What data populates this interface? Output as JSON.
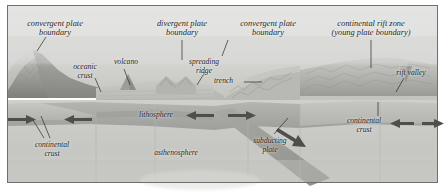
{
  "figure": {
    "type": "geologic-cross-section-block-diagram",
    "style": "grayscale airbrush illustration",
    "palette": {
      "sky": "#d8d8d6",
      "sky_low": "#c9c9c6",
      "land_light": "#cfcfcb",
      "land_mid": "#b0b0ac",
      "land_dark": "#8e8e8a",
      "ocean": "#bcbcb8",
      "lithosphere": "#a9a9a5",
      "asthenosphere": "#cbcbc7",
      "crust_block": "#bdbdb9",
      "slab": "#9d9d99",
      "arrow": "#54544f",
      "label_text": "#1c1c1c",
      "leader_line": "#2a2a26",
      "frame": "#7a7a76",
      "background": "#ffffff"
    }
  },
  "labels": {
    "convergent_left": {
      "line1": "convergent plate",
      "line2": "boundary",
      "x": 20,
      "y": 20
    },
    "oceanic_crust": {
      "line1": "oceanic",
      "line2": "crust",
      "x": 68,
      "y": 63
    },
    "volcano": {
      "line1": "volcano",
      "x": 112,
      "y": 58
    },
    "divergent": {
      "line1": "divergent plate",
      "line2": "boundary",
      "x": 152,
      "y": 20
    },
    "spreading_ridge": {
      "line1": "spreading",
      "line2": "ridge",
      "x": 185,
      "y": 58
    },
    "convergent_right": {
      "line1": "convergent plate",
      "line2": "boundary",
      "x": 228,
      "y": 20
    },
    "trench": {
      "line1": "trench",
      "x": 219,
      "y": 80
    },
    "continental_rift_zone": {
      "line1": "continental rift zone",
      "line2": "(young plate boundary)",
      "x": 330,
      "y": 20
    },
    "rift_valley": {
      "line1": "rift valley",
      "x": 389,
      "y": 70
    },
    "lithosphere": {
      "line1": "lithosphere",
      "x": 134,
      "y": 112
    },
    "asthenosphere": {
      "line1": "asthenosphere",
      "x": 148,
      "y": 150
    },
    "continental_crust_left": {
      "line1": "continental",
      "line2": "crust",
      "x": 28,
      "y": 142
    },
    "subducting_plate": {
      "line1": "subducting",
      "line2": "plate",
      "x": 251,
      "y": 138
    },
    "continental_crust_right": {
      "line1": "continental",
      "line2": "crust",
      "x": 341,
      "y": 118
    }
  },
  "motion_arrows": [
    {
      "name": "arrow-left-plate-east",
      "direction": "right",
      "x": 18,
      "y": 116
    },
    {
      "name": "arrow-oceanic-west",
      "direction": "left",
      "x": 74,
      "y": 116
    },
    {
      "name": "arrow-lithosphere-east",
      "direction": "left",
      "x": 196,
      "y": 113
    },
    {
      "name": "arrow-ridge-east",
      "direction": "right",
      "x": 244,
      "y": 113
    },
    {
      "name": "arrow-slab-descend",
      "direction": "down-right",
      "x": 300,
      "y": 138
    },
    {
      "name": "arrow-continent-west",
      "direction": "left",
      "x": 400,
      "y": 122
    },
    {
      "name": "arrow-continent-east",
      "direction": "right",
      "x": 433,
      "y": 122
    }
  ]
}
